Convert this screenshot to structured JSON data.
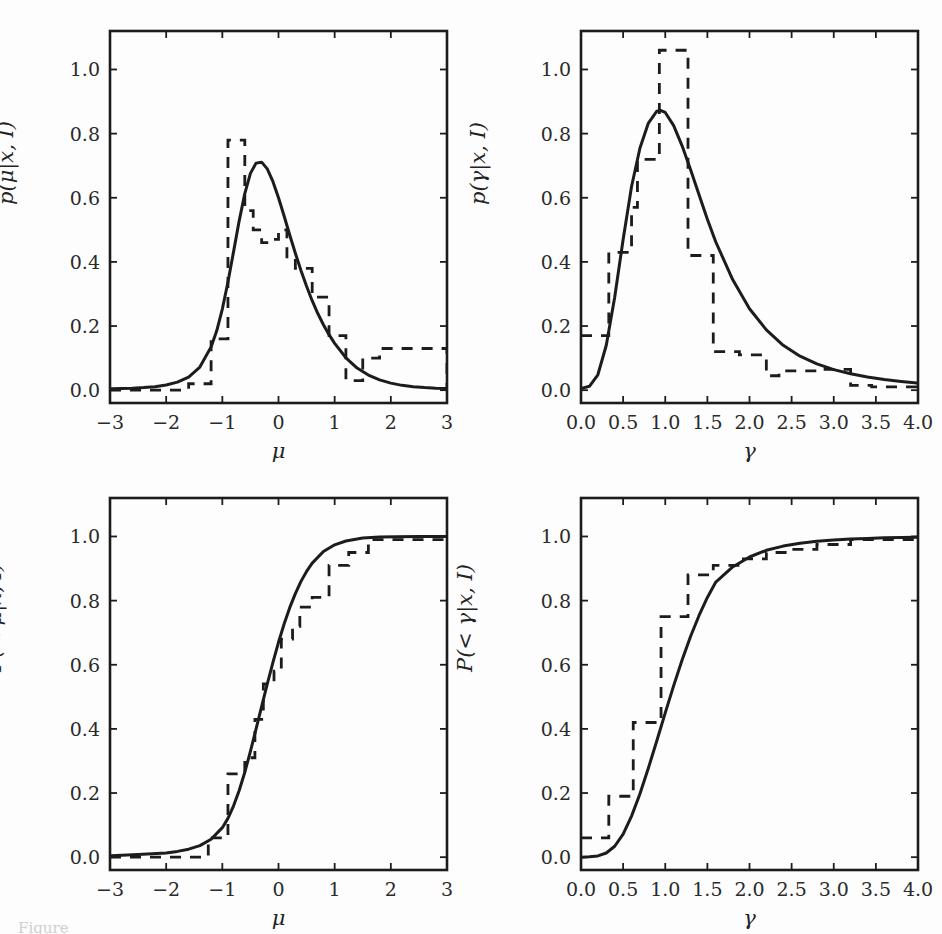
{
  "figure": {
    "background_color": "#fdfdfd",
    "line_color": "#1c1c1c",
    "caption_partial": "Figure"
  },
  "chart_data": [
    {
      "id": "posterior-pdf-mu",
      "type": "line",
      "position": "top-left",
      "title": "",
      "xlabel": "μ",
      "ylabel": "p(μ|x, I)",
      "xlim": [
        -3,
        3
      ],
      "ylim": [
        -0.04,
        1.12
      ],
      "xticks": [
        -3,
        -2,
        -1,
        0,
        1,
        2,
        3
      ],
      "xticklabels": [
        "−3",
        "−2",
        "−1",
        "0",
        "1",
        "2",
        "3"
      ],
      "yticks": [
        0.0,
        0.2,
        0.4,
        0.6,
        0.8,
        1.0
      ],
      "yticklabels": [
        "0.0",
        "0.2",
        "0.4",
        "0.6",
        "0.8",
        "1.0"
      ],
      "grid": false,
      "legend": "none",
      "series": [
        {
          "name": "analytic posterior",
          "style": "solid",
          "x": [
            -3.0,
            -2.8,
            -2.6,
            -2.4,
            -2.2,
            -2.0,
            -1.8,
            -1.6,
            -1.4,
            -1.2,
            -1.1,
            -1.0,
            -0.9,
            -0.8,
            -0.7,
            -0.6,
            -0.5,
            -0.4,
            -0.3,
            -0.2,
            -0.1,
            0.0,
            0.1,
            0.2,
            0.3,
            0.4,
            0.5,
            0.6,
            0.7,
            0.8,
            0.9,
            1.0,
            1.2,
            1.4,
            1.6,
            1.8,
            2.0,
            2.2,
            2.4,
            2.6,
            2.8,
            3.0
          ],
          "y": [
            0.004,
            0.005,
            0.006,
            0.008,
            0.011,
            0.016,
            0.025,
            0.041,
            0.072,
            0.135,
            0.185,
            0.253,
            0.337,
            0.432,
            0.528,
            0.613,
            0.676,
            0.708,
            0.711,
            0.69,
            0.651,
            0.6,
            0.543,
            0.484,
            0.427,
            0.373,
            0.324,
            0.279,
            0.239,
            0.204,
            0.173,
            0.146,
            0.101,
            0.069,
            0.047,
            0.032,
            0.022,
            0.015,
            0.011,
            0.008,
            0.006,
            0.005
          ]
        },
        {
          "name": "sampled histogram",
          "style": "dashed",
          "bin_edges": [
            -3.0,
            -1.6,
            -1.2,
            -0.9,
            -0.6,
            -0.45,
            -0.3,
            -0.15,
            0.0,
            0.15,
            0.3,
            0.6,
            0.9,
            1.2,
            1.5,
            1.8,
            3.0
          ],
          "bin_heights": [
            0.0,
            0.02,
            0.16,
            0.78,
            0.56,
            0.5,
            0.46,
            0.47,
            0.5,
            0.41,
            0.38,
            0.29,
            0.17,
            0.03,
            0.1,
            0.13,
            0.0
          ]
        }
      ]
    },
    {
      "id": "posterior-pdf-gamma",
      "type": "line",
      "position": "top-right",
      "title": "",
      "xlabel": "γ",
      "ylabel": "p(γ|x, I)",
      "xlim": [
        0.0,
        4.0
      ],
      "ylim": [
        -0.04,
        1.12
      ],
      "xticks": [
        0.0,
        0.5,
        1.0,
        1.5,
        2.0,
        2.5,
        3.0,
        3.5,
        4.0
      ],
      "xticklabels": [
        "0.0",
        "0.5",
        "1.0",
        "1.5",
        "2.0",
        "2.5",
        "3.0",
        "3.5",
        "4.0"
      ],
      "yticks": [
        0.0,
        0.2,
        0.4,
        0.6,
        0.8,
        1.0
      ],
      "yticklabels": [
        "0.0",
        "0.2",
        "0.4",
        "0.6",
        "0.8",
        "1.0"
      ],
      "grid": false,
      "legend": "none",
      "series": [
        {
          "name": "analytic posterior",
          "style": "solid",
          "x": [
            0.0,
            0.1,
            0.2,
            0.3,
            0.4,
            0.5,
            0.6,
            0.7,
            0.8,
            0.9,
            0.95,
            1.0,
            1.1,
            1.2,
            1.3,
            1.4,
            1.5,
            1.6,
            1.8,
            2.0,
            2.2,
            2.4,
            2.6,
            2.8,
            3.0,
            3.2,
            3.4,
            3.6,
            3.8,
            4.0
          ],
          "y": [
            0.005,
            0.012,
            0.048,
            0.14,
            0.29,
            0.47,
            0.635,
            0.755,
            0.833,
            0.87,
            0.872,
            0.866,
            0.825,
            0.762,
            0.688,
            0.61,
            0.533,
            0.462,
            0.345,
            0.254,
            0.188,
            0.14,
            0.106,
            0.082,
            0.064,
            0.051,
            0.041,
            0.033,
            0.027,
            0.022
          ]
        },
        {
          "name": "sampled histogram",
          "style": "dashed",
          "bin_edges": [
            0.0,
            0.33,
            0.6,
            0.67,
            0.93,
            1.05,
            1.27,
            1.57,
            1.88,
            2.2,
            2.35,
            2.55,
            2.85,
            3.2,
            3.45,
            4.0
          ],
          "bin_heights": [
            0.17,
            0.43,
            0.57,
            0.72,
            1.06,
            1.06,
            0.42,
            0.12,
            0.11,
            0.045,
            0.06,
            0.06,
            0.065,
            0.015,
            0.01
          ]
        }
      ]
    },
    {
      "id": "posterior-cdf-mu",
      "type": "line",
      "position": "bottom-left",
      "title": "",
      "xlabel": "μ",
      "ylabel": "P(< μ|x, I)",
      "xlim": [
        -3,
        3
      ],
      "ylim": [
        -0.04,
        1.12
      ],
      "xticks": [
        -3,
        -2,
        -1,
        0,
        1,
        2,
        3
      ],
      "xticklabels": [
        "−3",
        "−2",
        "−1",
        "0",
        "1",
        "2",
        "3"
      ],
      "yticks": [
        0.0,
        0.2,
        0.4,
        0.6,
        0.8,
        1.0
      ],
      "yticklabels": [
        "0.0",
        "0.2",
        "0.4",
        "0.6",
        "0.8",
        "1.0"
      ],
      "grid": false,
      "legend": "none",
      "series": [
        {
          "name": "analytic cdf",
          "style": "solid",
          "x": [
            -3.0,
            -2.5,
            -2.0,
            -1.8,
            -1.6,
            -1.4,
            -1.2,
            -1.0,
            -0.9,
            -0.8,
            -0.7,
            -0.6,
            -0.5,
            -0.4,
            -0.3,
            -0.2,
            -0.1,
            0.0,
            0.1,
            0.2,
            0.3,
            0.4,
            0.5,
            0.6,
            0.8,
            1.0,
            1.2,
            1.5,
            1.8,
            2.1,
            2.5,
            3.0
          ],
          "y": [
            0.004,
            0.008,
            0.013,
            0.018,
            0.025,
            0.036,
            0.056,
            0.092,
            0.121,
            0.16,
            0.208,
            0.265,
            0.33,
            0.399,
            0.47,
            0.54,
            0.607,
            0.67,
            0.727,
            0.778,
            0.822,
            0.86,
            0.891,
            0.917,
            0.953,
            0.974,
            0.986,
            0.995,
            0.998,
            0.999,
            1.0,
            1.0
          ]
        },
        {
          "name": "empirical cdf",
          "style": "dashed",
          "bin_edges": [
            -3.0,
            -1.55,
            -1.25,
            -0.9,
            -0.6,
            -0.42,
            -0.27,
            -0.08,
            0.05,
            0.25,
            0.38,
            0.6,
            0.9,
            1.25,
            1.6,
            3.0
          ],
          "step_values": [
            0.0,
            0.0,
            0.06,
            0.26,
            0.31,
            0.43,
            0.54,
            0.58,
            0.68,
            0.72,
            0.78,
            0.81,
            0.91,
            0.95,
            0.99
          ]
        }
      ]
    },
    {
      "id": "posterior-cdf-gamma",
      "type": "line",
      "position": "bottom-right",
      "title": "",
      "xlabel": "γ",
      "ylabel": "P(< γ|x, I)",
      "xlim": [
        0.0,
        4.0
      ],
      "ylim": [
        -0.04,
        1.12
      ],
      "xticks": [
        0.0,
        0.5,
        1.0,
        1.5,
        2.0,
        2.5,
        3.0,
        3.5,
        4.0
      ],
      "xticklabels": [
        "0.0",
        "0.5",
        "1.0",
        "1.5",
        "2.0",
        "2.5",
        "3.0",
        "3.5",
        "4.0"
      ],
      "yticks": [
        0.0,
        0.2,
        0.4,
        0.6,
        0.8,
        1.0
      ],
      "yticklabels": [
        "0.0",
        "0.2",
        "0.4",
        "0.6",
        "0.8",
        "1.0"
      ],
      "grid": false,
      "legend": "none",
      "series": [
        {
          "name": "analytic cdf",
          "style": "solid",
          "x": [
            0.0,
            0.1,
            0.2,
            0.3,
            0.4,
            0.5,
            0.6,
            0.7,
            0.8,
            0.9,
            1.0,
            1.1,
            1.2,
            1.3,
            1.4,
            1.5,
            1.6,
            1.8,
            2.0,
            2.2,
            2.4,
            2.6,
            2.8,
            3.0,
            3.2,
            3.4,
            3.6,
            3.8,
            4.0
          ],
          "y": [
            0.0,
            0.001,
            0.004,
            0.013,
            0.034,
            0.072,
            0.128,
            0.198,
            0.278,
            0.363,
            0.45,
            0.535,
            0.615,
            0.688,
            0.753,
            0.81,
            0.858,
            0.905,
            0.936,
            0.957,
            0.97,
            0.979,
            0.985,
            0.989,
            0.992,
            0.994,
            0.996,
            0.997,
            0.998
          ]
        },
        {
          "name": "empirical cdf",
          "style": "dashed",
          "bin_edges": [
            0.0,
            0.33,
            0.62,
            0.95,
            1.27,
            1.57,
            1.9,
            2.2,
            2.5,
            2.8,
            3.2,
            4.0
          ],
          "step_values": [
            0.06,
            0.19,
            0.42,
            0.75,
            0.88,
            0.91,
            0.93,
            0.95,
            0.96,
            0.975,
            0.99
          ]
        }
      ]
    }
  ]
}
